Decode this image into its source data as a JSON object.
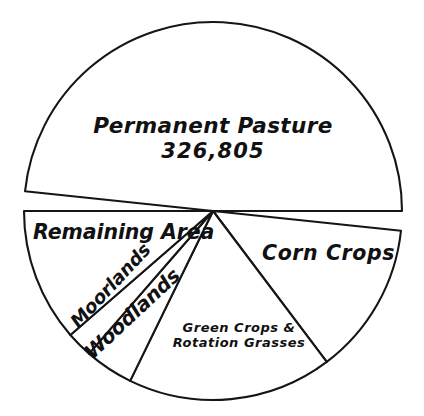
{
  "chart_data": {
    "type": "pie",
    "title": "",
    "subtitle": "",
    "xlabel": "",
    "ylabel": "",
    "legend": "none",
    "grid": false,
    "center": {
      "x": 213,
      "y": 211
    },
    "radius": 189,
    "slices": [
      {
        "id": "permanent-pasture",
        "label": "Permanent Pasture",
        "value_label": "326,805",
        "value": 326805,
        "start_angle_deg": 186,
        "end_angle_deg": 360,
        "sweep_deg": 174,
        "share_pct": 48.3
      },
      {
        "id": "corn-crops",
        "label": "Corn Crops",
        "value_label": "",
        "start_angle_deg": 6,
        "end_angle_deg": 53,
        "sweep_deg": 47,
        "share_pct": 13.1
      },
      {
        "id": "green-crops-rotation-grasses",
        "label": "Green Crops & Rotation Grasses",
        "label_line_1": "Green Crops &",
        "label_line_2": "Rotation Grasses",
        "value_label": "",
        "start_angle_deg": 53,
        "end_angle_deg": 116,
        "sweep_deg": 63,
        "share_pct": 17.5
      },
      {
        "id": "woodlands",
        "label": "Woodlands",
        "value_label": "",
        "start_angle_deg": 116,
        "end_angle_deg": 131,
        "sweep_deg": 15,
        "share_pct": 4.2
      },
      {
        "id": "moorlands",
        "label": "Moorlands",
        "value_label": "",
        "start_angle_deg": 131,
        "end_angle_deg": 139,
        "sweep_deg": 8,
        "share_pct": 2.2
      },
      {
        "id": "remaining-area",
        "label": "Remaining Area",
        "value_label": "",
        "start_angle_deg": 139,
        "end_angle_deg": 180,
        "sweep_deg": 41,
        "share_pct": 11.4
      }
    ],
    "colors": {
      "slice_fill": "#ffffff",
      "outline": "#151515",
      "text": "#111111",
      "background": "#ffffff"
    }
  },
  "labels": {
    "permanent_pasture": "Permanent Pasture",
    "permanent_pasture_value": "326,805",
    "remaining_area": "Remaining Area",
    "corn_crops": "Corn Crops",
    "green_crops_line1": "Green Crops &",
    "green_crops_line2": "Rotation Grasses",
    "moorlands": "Moorlands",
    "woodlands": "Woodlands"
  }
}
